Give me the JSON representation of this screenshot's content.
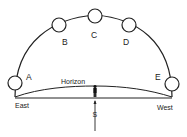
{
  "diagram": {
    "type": "sun-path",
    "positions": [
      {
        "id": "A",
        "label": "A"
      },
      {
        "id": "B",
        "label": "B"
      },
      {
        "id": "C",
        "label": "C"
      },
      {
        "id": "D",
        "label": "D"
      },
      {
        "id": "E",
        "label": "E"
      }
    ],
    "horizon_label": "Horizon",
    "east_label": "East",
    "west_label": "West",
    "south_label": "S"
  },
  "colors": {
    "stroke": "#222222",
    "fill": "#ffffff"
  }
}
